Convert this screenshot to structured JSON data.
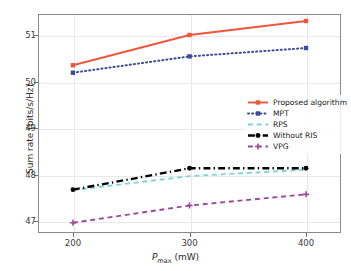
{
  "chart_data": {
    "type": "line",
    "title": "",
    "xlabel": "P_max (mW)",
    "xlabel_base": "P",
    "xlabel_sub": "max",
    "xlabel_unit": " (mW)",
    "ylabel": "Sum rate (bits/s/Hz)",
    "x": [
      200,
      300,
      400
    ],
    "categories": [
      "200",
      "300",
      "400"
    ],
    "xticks": [
      "200",
      "300",
      "400"
    ],
    "yticks": [
      "47",
      "48",
      "49",
      "50",
      "51"
    ],
    "ytick_values": [
      47,
      48,
      49,
      50,
      51
    ],
    "xlim": [
      170,
      430
    ],
    "ylim": [
      46.75,
      51.45
    ],
    "grid": true,
    "legend_position": "center-right",
    "series": [
      {
        "name": "Proposed algorithm",
        "values": [
          50.35,
          51.0,
          51.3
        ],
        "color": "#F0563C",
        "style": "solid",
        "marker": "square"
      },
      {
        "name": "MPT",
        "values": [
          50.19,
          50.54,
          50.72
        ],
        "color": "#3C4B9A",
        "style": "dotted",
        "marker": "square"
      },
      {
        "name": "RPS",
        "values": [
          47.67,
          47.97,
          48.11
        ],
        "color": "#7FD4D2",
        "style": "dashed",
        "marker": "none"
      },
      {
        "name": "Without RIS",
        "values": [
          47.68,
          48.14,
          48.14
        ],
        "color": "#000000",
        "style": "dashdot",
        "marker": "circle"
      },
      {
        "name": "VPG",
        "values": [
          46.97,
          47.34,
          47.58
        ],
        "color": "#9B4B96",
        "style": "dashed",
        "marker": "plus"
      }
    ]
  },
  "legend": {
    "items": [
      {
        "label": "Proposed algorithm"
      },
      {
        "label": "MPT"
      },
      {
        "label": "RPS"
      },
      {
        "label": "Without RIS"
      },
      {
        "label": "VPG"
      }
    ]
  },
  "axes": {
    "x_tick_labels": [
      "200",
      "300",
      "400"
    ],
    "y_tick_labels": [
      "47",
      "48",
      "49",
      "50",
      "51"
    ],
    "x_title_base": "P",
    "x_title_sub": "max",
    "x_title_unit": " (mW)",
    "y_title": "Sum rate (bits/s/Hz)"
  },
  "colors": {
    "proposed": "#F0563C",
    "mpt": "#3C4B9A",
    "rps": "#7FD4D2",
    "without_ris": "#000000",
    "vpg": "#9B4B96",
    "grid": "#E8E8EA",
    "frame": "#8A8A8A"
  }
}
